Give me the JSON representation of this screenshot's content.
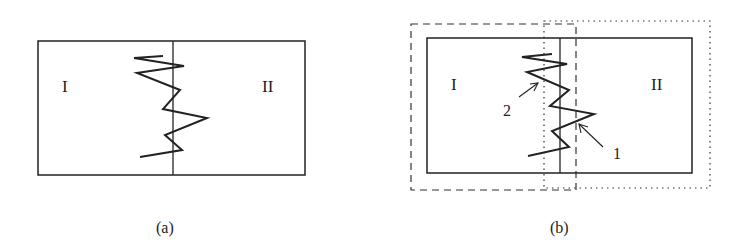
{
  "panels": [
    {
      "id": "a",
      "caption": "(a)",
      "region_left": "I",
      "region_right": "II",
      "box": {
        "x1": 38,
        "y1": 41,
        "x2": 305,
        "y2": 175
      },
      "divider_x": 173,
      "crack": [
        [
          163,
          56
        ],
        [
          134,
          58
        ],
        [
          184,
          66
        ],
        [
          137,
          73
        ],
        [
          180,
          90
        ],
        [
          163,
          109
        ],
        [
          207,
          118
        ],
        [
          165,
          135
        ],
        [
          182,
          150
        ],
        [
          140,
          157
        ]
      ]
    },
    {
      "id": "b",
      "caption": "(b)",
      "region_left": "I",
      "region_right": "II",
      "box": {
        "x1": 427,
        "y1": 38,
        "x2": 692,
        "y2": 173
      },
      "divider_x": 560,
      "crack": [
        [
          552,
          54
        ],
        [
          522,
          57
        ],
        [
          567,
          64
        ],
        [
          527,
          72
        ],
        [
          569,
          90
        ],
        [
          550,
          106
        ],
        [
          594,
          114
        ],
        [
          552,
          131
        ],
        [
          569,
          147
        ],
        [
          528,
          156
        ]
      ],
      "dashed_box": {
        "x1": 411,
        "y1": 24,
        "x2": 576,
        "y2": 190
      },
      "dotted_box": {
        "x1": 544,
        "y1": 21,
        "x2": 710,
        "y2": 188
      },
      "annotations": [
        {
          "label": "1",
          "text_x": 617,
          "text_y": 158,
          "arrow_from": [
            603,
            147
          ],
          "arrow_to": [
            579,
            124
          ]
        },
        {
          "label": "2",
          "text_x": 503,
          "text_y": 116,
          "arrow_from": [
            519,
            97
          ],
          "arrow_to": [
            538,
            83
          ]
        }
      ]
    }
  ],
  "colors": {
    "line": "#222222",
    "background": "#ffffff"
  }
}
